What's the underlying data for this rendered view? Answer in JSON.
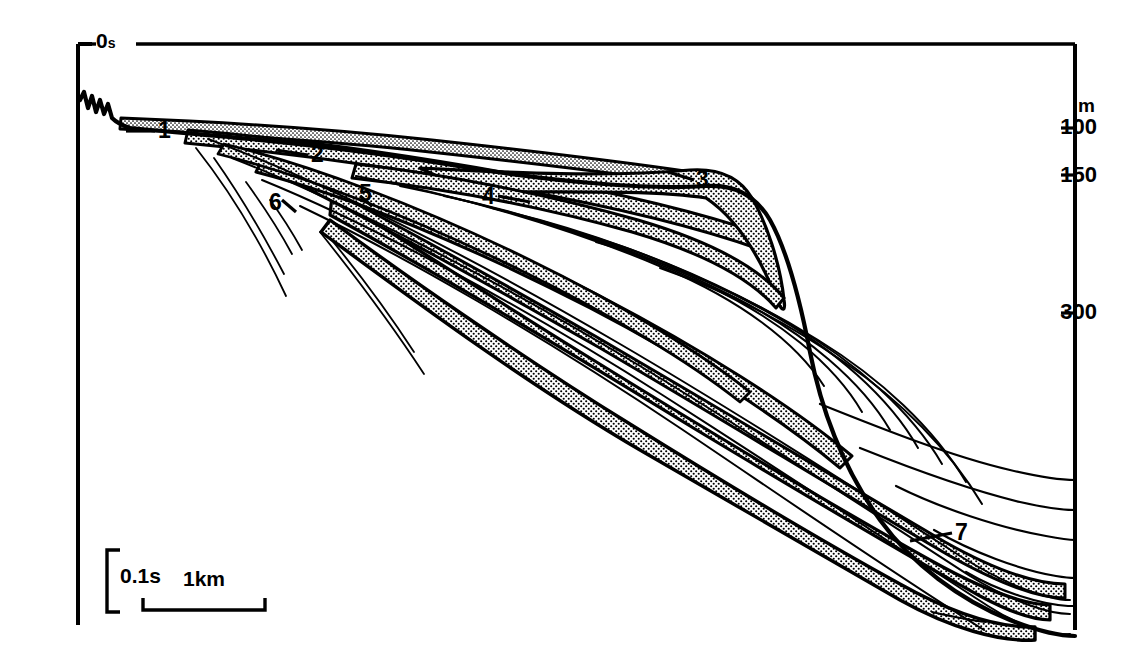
{
  "figure": {
    "type": "seismic-profile-line-drawing",
    "background_color": "#ffffff",
    "line_color": "#000000",
    "stipple_color": "#000000"
  },
  "time_axis": {
    "zero_label": "0",
    "zero_unit": "s"
  },
  "depth_axis": {
    "unit_label": "m",
    "ticks": [
      {
        "label": "100",
        "y": 128
      },
      {
        "label": "150",
        "y": 175
      },
      {
        "label": "300",
        "y": 313
      }
    ]
  },
  "scale_bars": {
    "vertical_label": "0.1s",
    "horizontal_label": "1km"
  },
  "unit_labels": [
    {
      "id": "1",
      "label": "1",
      "x": 158,
      "y": 119
    },
    {
      "id": "2",
      "label": "2",
      "x": 311,
      "y": 143
    },
    {
      "id": "3",
      "label": "3",
      "x": 696,
      "y": 168
    },
    {
      "id": "4",
      "label": "4",
      "x": 482,
      "y": 185
    },
    {
      "id": "5",
      "label": "5",
      "x": 359,
      "y": 182
    },
    {
      "id": "6",
      "label": "6",
      "x": 269,
      "y": 191
    },
    {
      "id": "7",
      "label": "7",
      "x": 955,
      "y": 521
    }
  ],
  "chart_data": {
    "type": "line",
    "title": "",
    "xlabel": "",
    "ylabel": "",
    "axis_ranges": {
      "two_way_time_top_s": 0,
      "depth_ticks_m": [
        100,
        150,
        300
      ]
    },
    "grid": false,
    "legend": "none"
  }
}
